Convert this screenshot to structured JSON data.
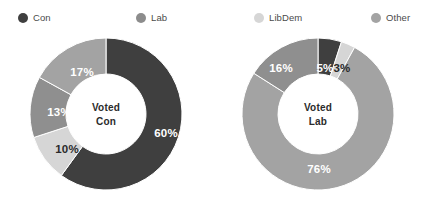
{
  "legend": {
    "items": [
      {
        "label": "Con",
        "color": "#3f3f3f",
        "x": 18
      },
      {
        "label": "Lab",
        "color": "#8c8c8c",
        "x": 136
      },
      {
        "label": "LibDem",
        "color": "#d6d6d6",
        "x": 254
      },
      {
        "label": "Other",
        "color": "#a3a3a3",
        "x": 371
      }
    ]
  },
  "chart_data": [
    {
      "type": "pie",
      "variant": "donut",
      "title": "Voted Con",
      "center_line1": "Voted",
      "center_line2": "Con",
      "categories": [
        "Con",
        "LibDem",
        "Other",
        "Lab"
      ],
      "values": [
        60,
        10,
        13,
        17
      ],
      "value_labels": [
        "60%",
        "10%",
        "13%",
        "17%"
      ],
      "colors": [
        "#3f3f3f",
        "#d6d6d6",
        "#8f8f8f",
        "#a3a3a3"
      ],
      "label_colors": [
        "on-dark",
        "on-light",
        "on-dark",
        "on-dark"
      ],
      "label_positions": [
        {
          "x": 166,
          "y": 133
        },
        {
          "x": 67,
          "y": 149
        },
        {
          "x": 59,
          "y": 112
        },
        {
          "x": 82,
          "y": 72
        }
      ],
      "start_angle_deg": 0,
      "legend_position": "top"
    },
    {
      "type": "pie",
      "variant": "donut",
      "title": "Voted Lab",
      "center_line1": "Voted",
      "center_line2": "Lab",
      "categories": [
        "Con",
        "LibDem",
        "Lab",
        "Other"
      ],
      "values": [
        5,
        3,
        76,
        16
      ],
      "value_labels": [
        "5%",
        "3%",
        "76%",
        "16%"
      ],
      "colors": [
        "#3f3f3f",
        "#d6d6d6",
        "#a3a3a3",
        "#8f8f8f"
      ],
      "label_colors": [
        "on-dark",
        "on-light",
        "on-dark",
        "on-dark"
      ],
      "label_positions": [
        {
          "x": 325,
          "y": 68
        },
        {
          "x": 342,
          "y": 68
        },
        {
          "x": 319,
          "y": 169
        },
        {
          "x": 281,
          "y": 68
        }
      ],
      "start_angle_deg": 0,
      "legend_position": "top"
    }
  ]
}
